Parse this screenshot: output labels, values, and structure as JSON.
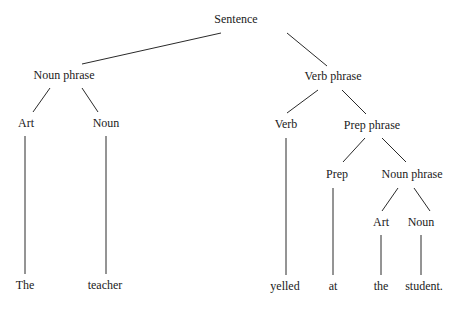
{
  "diagram": {
    "type": "parse-tree",
    "nodes": {
      "sentence": {
        "label": "Sentence",
        "x": 236,
        "y": 19
      },
      "np1": {
        "label": "Noun phrase",
        "x": 64,
        "y": 75
      },
      "vp": {
        "label": "Verb phrase",
        "x": 333,
        "y": 76
      },
      "art1": {
        "label": "Art",
        "x": 26,
        "y": 123
      },
      "noun1": {
        "label": "Noun",
        "x": 106,
        "y": 123
      },
      "verb": {
        "label": "Verb",
        "x": 286,
        "y": 124
      },
      "pp": {
        "label": "Prep phrase",
        "x": 372,
        "y": 125
      },
      "prep": {
        "label": "Prep",
        "x": 337,
        "y": 174
      },
      "np2": {
        "label": "Noun phrase",
        "x": 412,
        "y": 174
      },
      "art2": {
        "label": "Art",
        "x": 381,
        "y": 222
      },
      "noun2": {
        "label": "Noun",
        "x": 421,
        "y": 222
      },
      "w_the": {
        "label": "The",
        "x": 25,
        "y": 285
      },
      "w_teacher": {
        "label": "teacher",
        "x": 105,
        "y": 285
      },
      "w_yelled": {
        "label": "yelled",
        "x": 285,
        "y": 286
      },
      "w_at": {
        "label": "at",
        "x": 333,
        "y": 286
      },
      "w_the2": {
        "label": "the",
        "x": 381,
        "y": 286
      },
      "w_student": {
        "label": "student.",
        "x": 424,
        "y": 286
      }
    },
    "edges": [
      {
        "from": "sentence",
        "to": "np1",
        "x1": 221,
        "y1": 33,
        "x2": 82,
        "y2": 64
      },
      {
        "from": "sentence",
        "to": "vp",
        "x1": 287,
        "y1": 33,
        "x2": 327,
        "y2": 66
      },
      {
        "from": "np1",
        "to": "art1",
        "x1": 50,
        "y1": 88,
        "x2": 33,
        "y2": 112
      },
      {
        "from": "np1",
        "to": "noun1",
        "x1": 82,
        "y1": 88,
        "x2": 98,
        "y2": 112
      },
      {
        "from": "vp",
        "to": "verb",
        "x1": 318,
        "y1": 90,
        "x2": 287,
        "y2": 113
      },
      {
        "from": "vp",
        "to": "pp",
        "x1": 342,
        "y1": 90,
        "x2": 366,
        "y2": 114
      },
      {
        "from": "pp",
        "to": "prep",
        "x1": 365,
        "y1": 138,
        "x2": 343,
        "y2": 162
      },
      {
        "from": "pp",
        "to": "np2",
        "x1": 382,
        "y1": 138,
        "x2": 406,
        "y2": 162
      },
      {
        "from": "np2",
        "to": "art2",
        "x1": 398,
        "y1": 188,
        "x2": 382,
        "y2": 211
      },
      {
        "from": "np2",
        "to": "noun2",
        "x1": 414,
        "y1": 188,
        "x2": 430,
        "y2": 211
      },
      {
        "from": "art1",
        "to": "w_the",
        "x1": 25,
        "y1": 136,
        "x2": 25,
        "y2": 274
      },
      {
        "from": "noun1",
        "to": "w_teacher",
        "x1": 106,
        "y1": 136,
        "x2": 106,
        "y2": 274
      },
      {
        "from": "verb",
        "to": "w_yelled",
        "x1": 286,
        "y1": 138,
        "x2": 286,
        "y2": 275
      },
      {
        "from": "prep",
        "to": "w_at",
        "x1": 333,
        "y1": 188,
        "x2": 333,
        "y2": 275
      },
      {
        "from": "art2",
        "to": "w_the2",
        "x1": 381,
        "y1": 235,
        "x2": 381,
        "y2": 275
      },
      {
        "from": "noun2",
        "to": "w_student",
        "x1": 421,
        "y1": 235,
        "x2": 421,
        "y2": 275
      }
    ]
  }
}
